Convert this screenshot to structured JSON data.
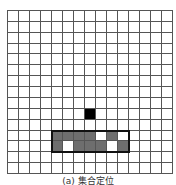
{
  "grid": {
    "rows": 15,
    "cols": 15,
    "line_color": "#555555",
    "cell_colors": {
      "black": "#000000",
      "gray": "#6e6e6e",
      "white": "#ffffff"
    },
    "filled_cells": [
      {
        "row": 9,
        "col": 7,
        "state": "black"
      },
      {
        "row": 11,
        "col": 4,
        "state": "gray"
      },
      {
        "row": 11,
        "col": 5,
        "state": "gray"
      },
      {
        "row": 11,
        "col": 6,
        "state": "gray"
      },
      {
        "row": 11,
        "col": 7,
        "state": "gray"
      },
      {
        "row": 11,
        "col": 8,
        "state": "white"
      },
      {
        "row": 11,
        "col": 9,
        "state": "gray"
      },
      {
        "row": 11,
        "col": 10,
        "state": "white"
      },
      {
        "row": 12,
        "col": 4,
        "state": "gray"
      },
      {
        "row": 12,
        "col": 5,
        "state": "white"
      },
      {
        "row": 12,
        "col": 6,
        "state": "gray"
      },
      {
        "row": 12,
        "col": 7,
        "state": "gray"
      },
      {
        "row": 12,
        "col": 8,
        "state": "gray"
      },
      {
        "row": 12,
        "col": 9,
        "state": "white"
      },
      {
        "row": 12,
        "col": 10,
        "state": "gray"
      }
    ],
    "highlight_box": {
      "row_start": 11,
      "row_end": 12,
      "col_start": 4,
      "col_end": 10
    }
  },
  "caption": "(a) 集合定位"
}
